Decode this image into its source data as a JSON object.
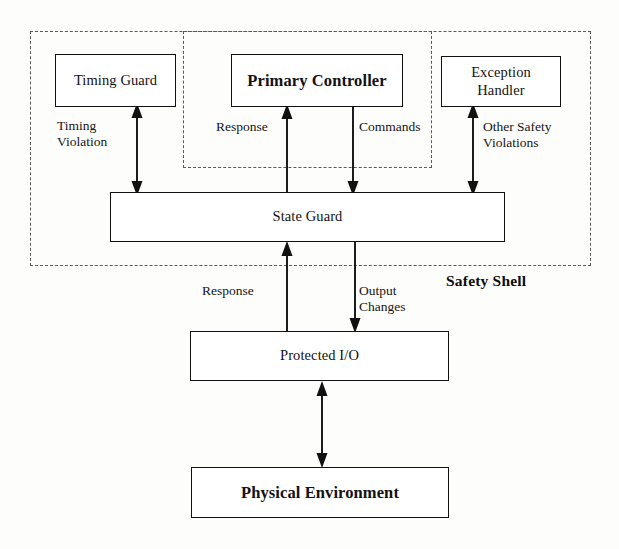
{
  "diagram": {
    "shell_label": "Safety Shell",
    "nodes": {
      "timing_guard": "Timing\nGuard",
      "primary_controller": "Primary\nController",
      "exception_handler": "Exception\nHandler",
      "state_guard": "State Guard",
      "protected_io": "Protected I/O",
      "physical_environment": "Physical Environment"
    },
    "edge_labels": {
      "timing_violation": "Timing\nViolation",
      "response_upper": "Response",
      "commands": "Commands",
      "other_safety_violations": "Other Safety\nViolations",
      "response_lower": "Response",
      "output_changes": "Output\nChanges"
    },
    "colors": {
      "line": "#111111",
      "dashed_border": "#5a5a5a",
      "background": "#fdfdfc",
      "text": "#121212"
    }
  }
}
